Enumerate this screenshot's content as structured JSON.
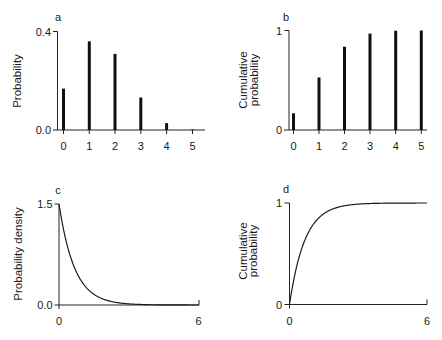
{
  "figure": {
    "panels": [
      {
        "id": "a",
        "label": "a",
        "ylabel": [
          "Probability"
        ],
        "yticks": [
          "0.0",
          "0.4"
        ],
        "xticks": [
          "0",
          "1",
          "2",
          "3",
          "4",
          "5"
        ]
      },
      {
        "id": "b",
        "label": "b",
        "ylabel": [
          "Cumulative",
          "probability"
        ],
        "yticks": [
          "0",
          "1"
        ],
        "xticks": [
          "0",
          "1",
          "2",
          "3",
          "4",
          "5"
        ]
      },
      {
        "id": "c",
        "label": "c",
        "ylabel": [
          "Probability density"
        ],
        "yticks": [
          "0.0",
          "1.5"
        ],
        "xticks": [
          "0",
          "6"
        ]
      },
      {
        "id": "d",
        "label": "d",
        "ylabel": [
          "Cumulative",
          "probability"
        ],
        "yticks": [
          "0",
          "1"
        ],
        "xticks": [
          "0",
          "6"
        ]
      }
    ]
  },
  "chart_data": [
    {
      "panel": "a",
      "type": "bar",
      "title": "",
      "categories": [
        0,
        1,
        2,
        3,
        4,
        5
      ],
      "values": [
        0.168,
        0.36,
        0.309,
        0.132,
        0.028,
        0.002
      ],
      "xlabel": "",
      "ylabel": "Probability",
      "ylim": [
        0,
        0.4
      ],
      "yticks": [
        0.0,
        0.4
      ],
      "grid": false
    },
    {
      "panel": "b",
      "type": "bar",
      "title": "",
      "categories": [
        0,
        1,
        2,
        3,
        4,
        5
      ],
      "values": [
        0.168,
        0.528,
        0.837,
        0.969,
        0.998,
        1.0
      ],
      "xlabel": "",
      "ylabel": "Cumulative probability",
      "ylim": [
        0,
        1
      ],
      "yticks": [
        0,
        1
      ],
      "grid": false
    },
    {
      "panel": "c",
      "type": "line",
      "title": "",
      "function": "1.5*exp(-1.5*x)",
      "x": [
        0,
        0.25,
        0.5,
        0.75,
        1,
        1.5,
        2,
        2.5,
        3,
        4,
        5,
        6
      ],
      "values": [
        1.5,
        1.031,
        0.709,
        0.487,
        0.335,
        0.158,
        0.075,
        0.035,
        0.017,
        0.004,
        0.001,
        0.0002
      ],
      "xlabel": "",
      "ylabel": "Probability density",
      "xlim": [
        0,
        6
      ],
      "ylim": [
        0,
        1.5
      ],
      "xticks": [
        0,
        6
      ],
      "yticks": [
        0.0,
        1.5
      ],
      "grid": false
    },
    {
      "panel": "d",
      "type": "line",
      "title": "",
      "function": "1-exp(-1.5*x)",
      "x": [
        0,
        0.25,
        0.5,
        0.75,
        1,
        1.5,
        2,
        2.5,
        3,
        4,
        5,
        6
      ],
      "values": [
        0,
        0.313,
        0.528,
        0.675,
        0.777,
        0.895,
        0.95,
        0.976,
        0.989,
        0.998,
        0.999,
        1.0
      ],
      "xlabel": "",
      "ylabel": "Cumulative probability",
      "xlim": [
        0,
        6
      ],
      "ylim": [
        0,
        1
      ],
      "xticks": [
        0,
        6
      ],
      "yticks": [
        0,
        1
      ],
      "grid": false
    }
  ]
}
